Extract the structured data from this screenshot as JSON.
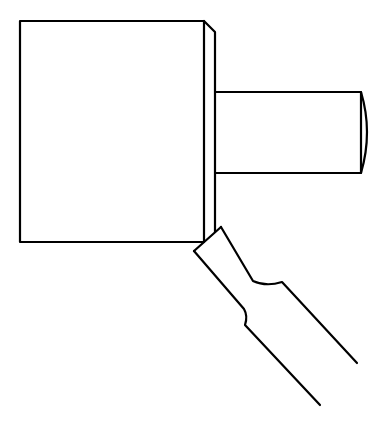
{
  "diagram": {
    "stroke_color": "#000000",
    "background_color": "#ffffff",
    "stroke_width": 2.2,
    "parts": [
      {
        "name": "workpiece-block",
        "shape": "rectangle",
        "x": 20,
        "y": 21,
        "width": 184,
        "height": 221
      },
      {
        "name": "chamfer-face",
        "shape": "polyline",
        "points": [
          [
            204,
            21
          ],
          [
            215,
            32
          ],
          [
            215,
            232
          ]
        ]
      },
      {
        "name": "shaft",
        "shape": "rectangle-with-arc-end",
        "x": 215,
        "y": 92,
        "width": 146,
        "height": 81,
        "arc_bulge_x": 369
      },
      {
        "name": "cutting-tool",
        "shape": "polyline",
        "tip": [
          [
            194,
            251
          ],
          [
            221,
            227
          ]
        ]
      }
    ]
  }
}
